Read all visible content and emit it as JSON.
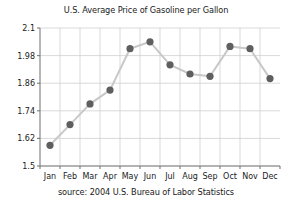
{
  "chart_data": {
    "type": "line",
    "title": "U.S. Average Price of Gasoline per Gallon",
    "caption": "source: 2004 U.S. Bureau of Labor Statistics",
    "categories": [
      "Jan",
      "Feb",
      "Mar",
      "Apr",
      "May",
      "Jun",
      "Jul",
      "Aug",
      "Sep",
      "Oct",
      "Nov",
      "Dec"
    ],
    "values": [
      1.59,
      1.68,
      1.77,
      1.83,
      2.01,
      2.04,
      1.94,
      1.9,
      1.89,
      2.02,
      2.01,
      1.88
    ],
    "xlabel": "",
    "ylabel": "",
    "ylim": [
      1.5,
      2.1
    ],
    "yticks": [
      "1.5",
      "1.62",
      "1.74",
      "1.86",
      "1.98",
      "2.1"
    ],
    "ytick_values": [
      1.5,
      1.62,
      1.74,
      1.86,
      1.98,
      2.1
    ],
    "grid": true,
    "legend": "none",
    "marker": "circle",
    "colors": {
      "marker": "#5f5f5f",
      "line": "#c8c8c8",
      "grid": "#cfcfcf",
      "axis": "#7a7a7a",
      "text": "#1a1a1a",
      "background": "#ffffff"
    }
  }
}
